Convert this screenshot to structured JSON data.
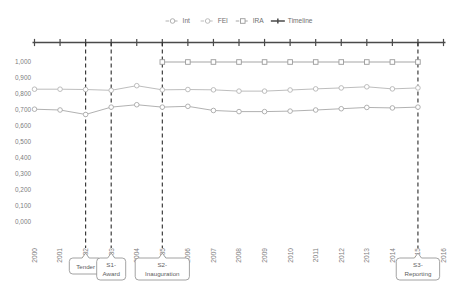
{
  "chart_data": {
    "type": "line",
    "title": "",
    "xlabel": "",
    "ylabel": "",
    "ylim": [
      0.0,
      1.0
    ],
    "ytick_labels": [
      "1,000",
      "0,900",
      "0,800",
      "0,700",
      "0,600",
      "0,500",
      "0,400",
      "0,300",
      "0,200",
      "0,100",
      "0,000"
    ],
    "ytick_values": [
      1.0,
      0.9,
      0.8,
      0.7,
      0.6,
      0.5,
      0.4,
      0.3,
      0.2,
      0.1,
      0.0
    ],
    "x": [
      2000,
      2001,
      2002,
      2003,
      2004,
      2005,
      2006,
      2007,
      2008,
      2009,
      2010,
      2011,
      2012,
      2013,
      2014,
      2015,
      2016
    ],
    "xtick_labels": [
      "2000",
      "2001",
      "2002",
      "2003",
      "2004",
      "2005",
      "2006",
      "2007",
      "2008",
      "2009",
      "2010",
      "2011",
      "2012",
      "2013",
      "2014",
      "2015",
      "2016"
    ],
    "grid": false,
    "legend_position": "top-center",
    "series": [
      {
        "name": "Int",
        "marker": "circle",
        "color": "#a8a8a8",
        "x": [
          2000,
          2001,
          2002,
          2003,
          2004,
          2005,
          2006,
          2007,
          2008,
          2009,
          2010,
          2011,
          2012,
          2013,
          2014,
          2015
        ],
        "values": [
          0.705,
          0.7,
          0.672,
          0.718,
          0.733,
          0.718,
          0.723,
          0.697,
          0.69,
          0.69,
          0.693,
          0.7,
          0.708,
          0.716,
          0.713,
          0.718
        ]
      },
      {
        "name": "FEI",
        "marker": "circle",
        "color": "#b5b5b5",
        "x": [
          2000,
          2001,
          2002,
          2003,
          2004,
          2005,
          2006,
          2007,
          2008,
          2009,
          2010,
          2011,
          2012,
          2013,
          2014,
          2015
        ],
        "values": [
          0.83,
          0.83,
          0.828,
          0.823,
          0.852,
          0.826,
          0.828,
          0.826,
          0.818,
          0.818,
          0.825,
          0.832,
          0.838,
          0.845,
          0.832,
          0.838
        ]
      },
      {
        "name": "IRA",
        "marker": "square",
        "color": "#9b9b9b",
        "x": [
          2005,
          2006,
          2007,
          2008,
          2009,
          2010,
          2011,
          2012,
          2013,
          2014,
          2015
        ],
        "values": [
          1.0,
          1.0,
          1.0,
          1.0,
          1.0,
          1.0,
          1.0,
          1.0,
          1.0,
          1.0,
          1.0
        ]
      }
    ],
    "timeline": {
      "name": "Timeline",
      "color": "#4a4a4a",
      "ticks": [
        2000,
        2001,
        2002,
        2003,
        2004,
        2005,
        2006,
        2007,
        2008,
        2009,
        2010,
        2011,
        2012,
        2013,
        2014,
        2015,
        2016
      ]
    },
    "legend": [
      {
        "label": "Int",
        "marker": "circle",
        "color": "#a8a8a8"
      },
      {
        "label": "FEI",
        "marker": "circle",
        "color": "#b5b5b5"
      },
      {
        "label": "IRA",
        "marker": "square",
        "color": "#9b9b9b"
      },
      {
        "label": "Timeline",
        "marker": "line",
        "color": "#4a4a4a"
      }
    ],
    "annotations": [
      {
        "x": 2002,
        "line1": "Tender",
        "line2": ""
      },
      {
        "x": 2003,
        "line1": "S1-",
        "line2": "Award"
      },
      {
        "x": 2005,
        "line1": "S2-",
        "line2": "Inauguration"
      },
      {
        "x": 2015,
        "line1": "S3-",
        "line2": "Reporting"
      }
    ]
  }
}
